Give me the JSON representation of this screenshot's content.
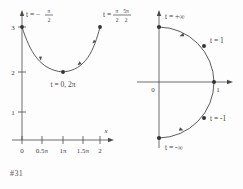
{
  "page": {
    "background": "#fdfdfd",
    "ink_color": "#444444"
  },
  "figures": [
    {
      "id": "figure-31",
      "caption": "#31",
      "axes": {
        "x_label": "x",
        "y_label": "y",
        "x_ticks": [
          "0",
          "0.5π",
          "1π",
          "1.5π",
          "2"
        ],
        "y_ticks": [
          "1",
          "2",
          "3"
        ],
        "origin_label": "0"
      },
      "annotations": [
        {
          "name": "start-point-label",
          "text": "t = -π/2",
          "t_text": "t =",
          "num": "π",
          "den": "2",
          "sign": "-"
        },
        {
          "name": "vertex-point-label",
          "text": "t = 0, 2π"
        },
        {
          "name": "end-point-label",
          "text": "t = π/2, 5π/2",
          "t_text": "t =",
          "num1": "π",
          "den1": "2",
          "num2": "5π",
          "den2": "2"
        }
      ],
      "marked_points": [
        {
          "name": "point-start",
          "x": "0",
          "y": "3"
        },
        {
          "name": "point-vertex",
          "x": "1",
          "y": "2"
        },
        {
          "name": "point-end",
          "x": "2",
          "y": "3"
        }
      ],
      "curve_description": "downward-then-upward parabolic arc with direction arrows"
    },
    {
      "id": "figure-33",
      "caption": "#33",
      "axes": {
        "origin_label": "0",
        "x_point_label": "1"
      },
      "annotations": [
        {
          "name": "top-point-label",
          "text": "t = +∞"
        },
        {
          "name": "upper-point-label",
          "text": "t = 1"
        },
        {
          "name": "lower-point-label",
          "text": "t = -1"
        },
        {
          "name": "bottom-point-label",
          "text": "t = -∞"
        }
      ],
      "marked_points": [
        {
          "name": "point-top"
        },
        {
          "name": "point-upper"
        },
        {
          "name": "point-right"
        },
        {
          "name": "point-lower"
        },
        {
          "name": "point-bottom"
        }
      ],
      "curve_description": "right-half semicircular arc traversed upward with direction arrows"
    }
  ]
}
